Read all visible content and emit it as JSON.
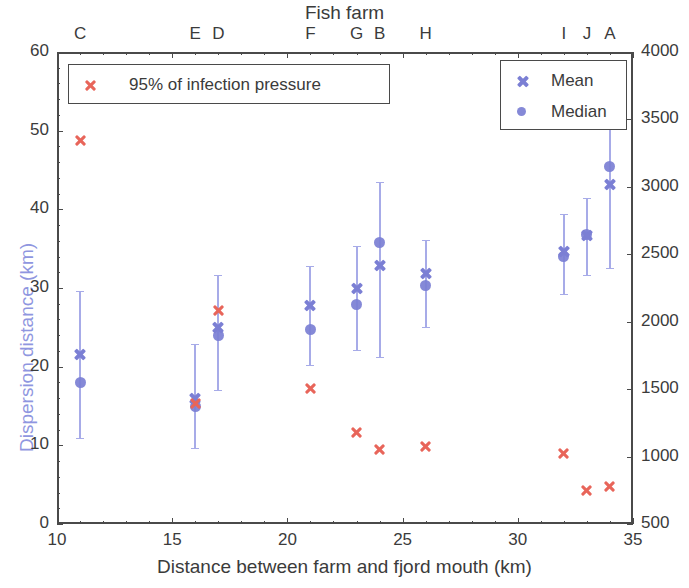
{
  "chart_data": {
    "type": "scatter",
    "title": "Fish farm",
    "xlabel": "Distance between farm and fjord mouth (km)",
    "ylabel_left": "Dispersion distance (km)",
    "ylabel_right": "",
    "xlim": [
      10,
      35
    ],
    "ylim_left": [
      0,
      60
    ],
    "ylim_right": [
      500,
      4000
    ],
    "xticks": [
      10,
      15,
      20,
      25,
      30,
      35
    ],
    "xtick_labels": [
      "10",
      "15",
      "20",
      "25",
      "30",
      "35"
    ],
    "yticks_left": [
      0,
      10,
      20,
      30,
      40,
      50,
      60
    ],
    "ytick_labels_left": [
      "0",
      "10",
      "20",
      "30",
      "40",
      "50",
      "60"
    ],
    "yticks_right": [
      500,
      1000,
      1500,
      2000,
      2500,
      3000,
      3500,
      4000
    ],
    "ytick_labels_right": [
      "500",
      "1000",
      "1500",
      "2000",
      "2500",
      "3000",
      "3500",
      "4000"
    ],
    "grid": false,
    "legend_position": [
      "upper left",
      "upper right"
    ],
    "colors": {
      "mean_median": "#7b7fd4",
      "errorbar": "#a7abe8",
      "infection": "#e8655a",
      "ylabel_left": "#8f96e0",
      "axis": "#4a4a4a"
    },
    "series": [
      {
        "name": "Mean",
        "marker": "x",
        "color": "#7b7fd4",
        "axis": "left"
      },
      {
        "name": "Median",
        "marker": "o",
        "color": "#7b7fd4",
        "axis": "left"
      },
      {
        "name": "95% of infection pressure",
        "marker": "x",
        "color": "#e8655a",
        "axis": "right"
      }
    ],
    "farms": [
      {
        "label": "C",
        "x": 11,
        "mean": 21.5,
        "median": 18.0,
        "err_low": 10.9,
        "err_high": 29.6,
        "infection_left_scale": 48.7,
        "infection_right_value": 3330
      },
      {
        "label": "E",
        "x": 16,
        "mean": 16.0,
        "median": 14.9,
        "err_low": 9.7,
        "err_high": 22.9,
        "infection_left_scale": 15.3,
        "infection_right_value": 1400
      },
      {
        "label": "D",
        "x": 17,
        "mean": 25.0,
        "median": 23.9,
        "err_low": 17.0,
        "err_high": 31.6,
        "infection_left_scale": 27.1,
        "infection_right_value": 2080
      },
      {
        "label": "F",
        "x": 21,
        "mean": 27.8,
        "median": 24.7,
        "err_low": 20.2,
        "err_high": 32.8,
        "infection_left_scale": 17.2,
        "infection_right_value": 1510
      },
      {
        "label": "G",
        "x": 23,
        "mean": 29.9,
        "median": 27.9,
        "err_low": 22.1,
        "err_high": 35.3,
        "infection_left_scale": 11.6,
        "infection_right_value": 1180
      },
      {
        "label": "B",
        "x": 24,
        "mean": 32.8,
        "median": 35.8,
        "err_low": 21.2,
        "err_high": 43.5,
        "infection_left_scale": 9.5,
        "infection_right_value": 1060
      },
      {
        "label": "H",
        "x": 26,
        "mean": 31.9,
        "median": 30.3,
        "err_low": 25.1,
        "err_high": 36.1,
        "infection_left_scale": 9.8,
        "infection_right_value": 1080
      },
      {
        "label": "I",
        "x": 32,
        "mean": 34.6,
        "median": 34.0,
        "err_low": 29.3,
        "err_high": 39.4,
        "infection_left_scale": 9.0,
        "infection_right_value": 1030
      },
      {
        "label": "J",
        "x": 33,
        "mean": 36.7,
        "median": 36.8,
        "err_low": 31.6,
        "err_high": 41.4,
        "infection_left_scale": 4.2,
        "infection_right_value": 750
      },
      {
        "label": "A",
        "x": 34,
        "mean": 43.2,
        "median": 45.5,
        "err_low": 32.5,
        "err_high": 52.5,
        "infection_left_scale": 4.8,
        "infection_right_value": 790
      }
    ]
  },
  "legend_left": {
    "items": [
      {
        "label": "95% of infection pressure",
        "marker": "x",
        "color": "#e8655a"
      }
    ]
  },
  "legend_right": {
    "items": [
      {
        "label": "Mean",
        "marker": "x",
        "color": "#7b7fd4"
      },
      {
        "label": "Median",
        "marker": "o",
        "color": "#7b7fd4"
      }
    ]
  }
}
